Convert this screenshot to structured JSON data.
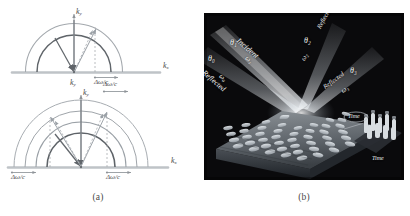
{
  "figure": {
    "panels": [
      {
        "id": "a",
        "caption": "(a)",
        "type": "k-space-diagram"
      },
      {
        "id": "b",
        "caption": "(b)",
        "type": "3d-illustration"
      }
    ]
  },
  "panel_a": {
    "caption": "(a)",
    "diagrams": [
      {
        "name": "single-beam-k-space",
        "axis_y_label": "k",
        "axis_y_sub": "y",
        "axis_x_label": "k",
        "axis_x_sub": "x",
        "origin_label": "k",
        "origin_sub": "y",
        "bandwidth_labels": [
          {
            "text": "Δω/c",
            "position": "right-of-origin"
          }
        ],
        "arc_count": 2,
        "arc_radii": [
          40,
          55
        ],
        "beams": [
          {
            "name": "normal-incidence-arrow",
            "angle_deg": 90
          },
          {
            "name": "tilted-beam-arrow",
            "angle_deg": 72
          }
        ]
      },
      {
        "name": "multi-beam-k-space",
        "axis_y_label": "k",
        "axis_y_sub": "y",
        "axis_x_label": "k",
        "axis_x_sub": "x",
        "bandwidth_labels": [
          {
            "text": "Δω/c",
            "position": "top-right"
          },
          {
            "text": "Δω/c",
            "position": "bottom-left"
          },
          {
            "text": "Δω/c",
            "position": "bottom-right"
          }
        ],
        "arc_count": 4,
        "arc_radii": [
          38,
          50,
          62,
          74
        ],
        "beams": [
          {
            "name": "left-tilted-beam-arrow",
            "angle_deg": 118
          },
          {
            "name": "vertical-beam-arrow",
            "angle_deg": 90
          },
          {
            "name": "right-tilted-beam-arrow",
            "angle_deg": 62
          }
        ]
      }
    ]
  },
  "panel_b": {
    "caption": "(b)",
    "scene_name": "metasurface-beam-steering-illustration",
    "labels": [
      {
        "id": "incident-label",
        "text": "Incident",
        "style": "italic"
      },
      {
        "id": "reflected-label",
        "text": "Reflected",
        "style": "italic"
      },
      {
        "id": "reflected-label-2",
        "text": "Reflected",
        "style": "italic"
      },
      {
        "id": "reflected-label-3",
        "text": "Reflected",
        "style": "italic"
      },
      {
        "id": "angle-theta-0",
        "text": "θ₀",
        "style": "italic-math"
      },
      {
        "id": "angle-theta-1",
        "text": "θ₁",
        "style": "italic-math"
      },
      {
        "id": "angle-theta-2",
        "text": "θ₂",
        "style": "italic-math"
      },
      {
        "id": "angle-theta-3",
        "text": "θ₃",
        "style": "italic-math"
      },
      {
        "id": "frequency-omega-0",
        "text": "ω₀",
        "style": "italic-math"
      },
      {
        "id": "frequency-omega-1",
        "text": "ω₁",
        "style": "italic-math"
      },
      {
        "id": "frequency-omega-2",
        "text": "ω₂",
        "style": "italic-math"
      },
      {
        "id": "frequency-omega-3",
        "text": "ω₃",
        "style": "italic-math"
      },
      {
        "id": "time-varying-label",
        "text": "Time",
        "style": "italic"
      },
      {
        "id": "time-modulation-label",
        "text": "Time",
        "style": "italic"
      }
    ],
    "colors": {
      "background": "#0a0a0c",
      "beam_glow": "#dfe7ee",
      "surface": "#6f7479",
      "element": "#c9cfd4",
      "label_text": "#f2f2f2"
    },
    "metasurface": {
      "name": "reconfigurable-metasurface-array",
      "rows": 6,
      "cols": 8,
      "element_shape": "rounded-rectangle"
    }
  },
  "colors": {
    "paper": "#ffffff",
    "ink": "#4d4d4d",
    "arc_light": "#9aa0a6",
    "arc_dark": "#5a5f64",
    "axis": "#7f8488",
    "baseline": "#b9bdc1",
    "dashed": "#a8acb0"
  }
}
